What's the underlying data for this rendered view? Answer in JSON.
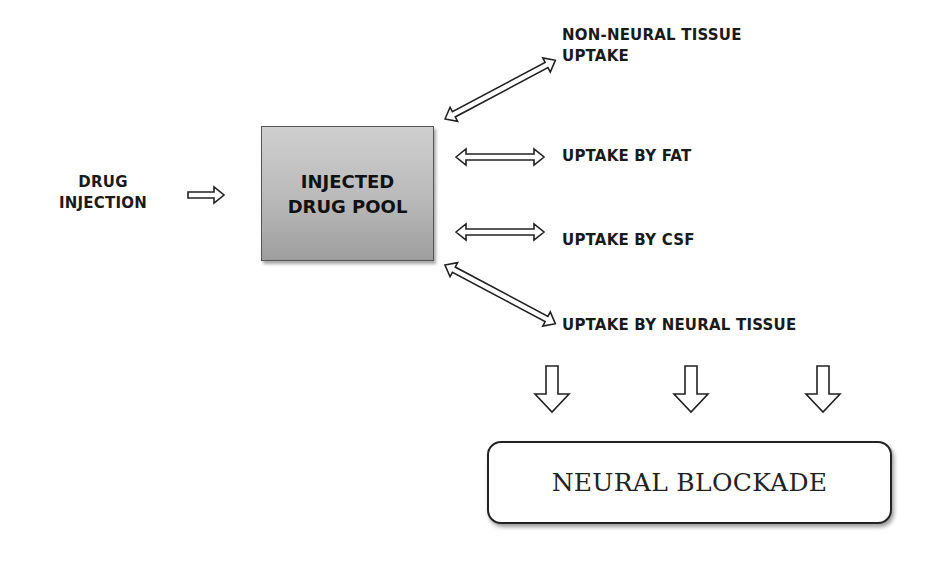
{
  "diagram": {
    "source": {
      "label_line1": "DRUG",
      "label_line2": "INJECTION"
    },
    "pool": {
      "label": "INJECTED\nDRUG POOL",
      "fill_top": "#cfcfcf",
      "fill_bottom": "#9e9e9e"
    },
    "uptakes": [
      {
        "line1": "NON-NEURAL TISSUE",
        "line2": "UPTAKE",
        "arrow": "bidirectional-diagonal-up"
      },
      {
        "line1": "UPTAKE BY FAT",
        "arrow": "bidirectional-horizontal"
      },
      {
        "line1": "UPTAKE BY CSF",
        "arrow": "bidirectional-horizontal"
      },
      {
        "line1": "UPTAKE BY NEURAL TISSUE",
        "arrow": "bidirectional-diagonal-down"
      }
    ],
    "down_arrows": 3,
    "outcome": {
      "label": "NEURAL BLOCKADE"
    },
    "icons": {
      "source_to_pool": "right-hollow-arrow-icon",
      "exchange": "double-headed-hollow-arrow-icon",
      "to_outcome": "down-hollow-arrow-icon"
    }
  }
}
